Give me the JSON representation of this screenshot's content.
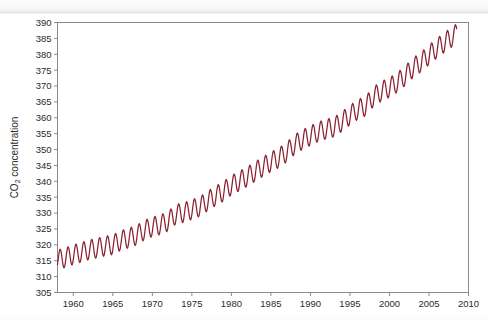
{
  "chart_data": {
    "type": "line",
    "title": "",
    "xlabel": "",
    "ylabel": "CO2 concentration",
    "ylabel_parts": {
      "pre": "CO",
      "sub": "2",
      "post": " concentration"
    },
    "xlim": [
      1958,
      2010
    ],
    "ylim": [
      305,
      390
    ],
    "xticks": [
      1960,
      1965,
      1970,
      1975,
      1980,
      1985,
      1990,
      1995,
      2000,
      2005,
      2010
    ],
    "yticks": [
      305,
      310,
      315,
      320,
      325,
      330,
      335,
      340,
      345,
      350,
      355,
      360,
      365,
      370,
      375,
      380,
      385,
      390
    ],
    "xtick_labels": [
      "1960",
      "1965",
      "1970",
      "1975",
      "1980",
      "1985",
      "1990",
      "1995",
      "2000",
      "2005",
      "2010"
    ],
    "ytick_labels": [
      "305",
      "310",
      "315",
      "320",
      "325",
      "330",
      "335",
      "340",
      "345",
      "350",
      "355",
      "360",
      "365",
      "370",
      "375",
      "380",
      "385",
      "390"
    ],
    "grid": false,
    "legend": false,
    "line_color": "#8B2030",
    "axis_color": "#8a8a8a",
    "background": "#ffffff",
    "series": [
      {
        "name": "Mauna Loa monthly mean CO2",
        "units": "ppm",
        "seasonal_amplitude": 3.1,
        "seasonal_peak_month": 5,
        "annual_means": [
          {
            "x": 1958,
            "y": 315.3
          },
          {
            "x": 1959,
            "y": 315.98
          },
          {
            "x": 1960,
            "y": 316.91
          },
          {
            "x": 1961,
            "y": 317.64
          },
          {
            "x": 1962,
            "y": 318.45
          },
          {
            "x": 1963,
            "y": 318.99
          },
          {
            "x": 1964,
            "y": 319.62
          },
          {
            "x": 1965,
            "y": 320.04
          },
          {
            "x": 1966,
            "y": 321.38
          },
          {
            "x": 1967,
            "y": 322.16
          },
          {
            "x": 1968,
            "y": 323.04
          },
          {
            "x": 1969,
            "y": 324.62
          },
          {
            "x": 1970,
            "y": 325.68
          },
          {
            "x": 1971,
            "y": 326.32
          },
          {
            "x": 1972,
            "y": 327.45
          },
          {
            "x": 1973,
            "y": 329.68
          },
          {
            "x": 1974,
            "y": 330.18
          },
          {
            "x": 1975,
            "y": 331.11
          },
          {
            "x": 1976,
            "y": 332.04
          },
          {
            "x": 1977,
            "y": 333.83
          },
          {
            "x": 1978,
            "y": 335.4
          },
          {
            "x": 1979,
            "y": 336.84
          },
          {
            "x": 1980,
            "y": 338.75
          },
          {
            "x": 1981,
            "y": 340.11
          },
          {
            "x": 1982,
            "y": 341.45
          },
          {
            "x": 1983,
            "y": 343.05
          },
          {
            "x": 1984,
            "y": 344.65
          },
          {
            "x": 1985,
            "y": 346.12
          },
          {
            "x": 1986,
            "y": 347.42
          },
          {
            "x": 1987,
            "y": 349.19
          },
          {
            "x": 1988,
            "y": 351.57
          },
          {
            "x": 1989,
            "y": 353.12
          },
          {
            "x": 1990,
            "y": 354.39
          },
          {
            "x": 1991,
            "y": 355.61
          },
          {
            "x": 1992,
            "y": 356.45
          },
          {
            "x": 1993,
            "y": 357.1
          },
          {
            "x": 1994,
            "y": 358.83
          },
          {
            "x": 1995,
            "y": 360.82
          },
          {
            "x": 1996,
            "y": 362.61
          },
          {
            "x": 1997,
            "y": 363.73
          },
          {
            "x": 1998,
            "y": 366.7
          },
          {
            "x": 1999,
            "y": 368.38
          },
          {
            "x": 2000,
            "y": 369.55
          },
          {
            "x": 2001,
            "y": 371.14
          },
          {
            "x": 2002,
            "y": 373.28
          },
          {
            "x": 2003,
            "y": 375.8
          },
          {
            "x": 2004,
            "y": 377.52
          },
          {
            "x": 2005,
            "y": 379.8
          },
          {
            "x": 2006,
            "y": 381.9
          },
          {
            "x": 2007,
            "y": 383.79
          },
          {
            "x": 2008,
            "y": 385.6
          }
        ]
      }
    ]
  }
}
